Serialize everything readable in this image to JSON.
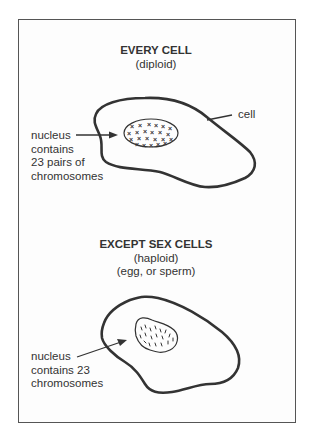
{
  "diagram": {
    "colors": {
      "ink": "#333333",
      "frame": "#555555",
      "background": "#ffffff"
    },
    "diploid_section": {
      "heading": "EVERY CELL",
      "subheading": "(diploid)",
      "cell_label": "cell",
      "nucleus_label": [
        "nucleus",
        "contains",
        "23 pairs of",
        "chromosomes"
      ],
      "chromosome_marker": "×"
    },
    "haploid_section": {
      "heading": "EXCEPT SEX CELLS",
      "subheading": "(haploid)",
      "subheading2": "(egg, or sperm)",
      "nucleus_label": [
        "nucleus",
        "contains 23",
        "chromosomes"
      ],
      "chromosome_marker": "single strand"
    }
  }
}
